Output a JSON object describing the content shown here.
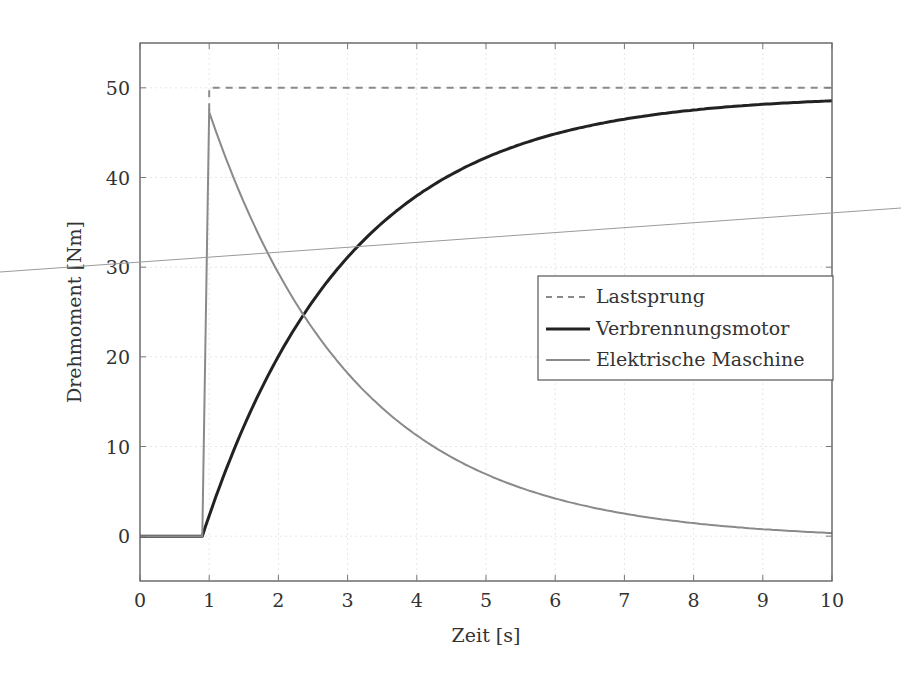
{
  "chart_data": {
    "type": "line",
    "title": "",
    "xlabel": "Zeit [s]",
    "ylabel": "Drehmoment [Nm]",
    "xlim": [
      0,
      10
    ],
    "ylim": [
      -5,
      55
    ],
    "xticks": [
      0,
      1,
      2,
      3,
      4,
      5,
      6,
      7,
      8,
      9,
      10
    ],
    "yticks": [
      0,
      10,
      20,
      30,
      40,
      50
    ],
    "grid": true,
    "legend_position": "right-center",
    "series": [
      {
        "name": "Lastsprung",
        "style": "dashed",
        "color": "#8a8a8a",
        "x": [
          1,
          1,
          10
        ],
        "y": [
          47.5,
          50,
          50
        ]
      },
      {
        "name": "Verbrennungsmotor",
        "style": "solid-thick",
        "color": "#222222",
        "x": [
          0,
          0.9,
          1,
          1.5,
          2,
          2.5,
          3,
          3.5,
          4,
          4.5,
          5,
          5.5,
          6,
          6.5,
          7,
          7.5,
          8,
          8.5,
          9,
          9.5,
          10
        ],
        "y": [
          0,
          0,
          2.4,
          12.2,
          19.9,
          25.9,
          30.6,
          34.3,
          37.2,
          39.5,
          41.3,
          42.7,
          43.8,
          44.6,
          45.3,
          45.8,
          46.3,
          46.6,
          46.9,
          47.1,
          47.3
        ]
      },
      {
        "name": "Elektrische Maschine",
        "style": "solid",
        "color": "#8a8a8a",
        "x": [
          0,
          0.9,
          1,
          1.5,
          2,
          2.5,
          3,
          3.5,
          4,
          4.5,
          5,
          5.5,
          6,
          6.5,
          7,
          7.5,
          8,
          8.5,
          9,
          9.5,
          10
        ],
        "y": [
          0,
          0,
          47.6,
          37.1,
          28.9,
          22.5,
          17.5,
          13.6,
          10.6,
          8.3,
          6.4,
          5.0,
          3.9,
          3.1,
          2.4,
          1.9,
          1.4,
          1.1,
          0.8,
          0.5,
          0.2
        ]
      }
    ],
    "annotations": []
  },
  "legend": {
    "items": [
      {
        "label": "Lastsprung"
      },
      {
        "label": "Verbrennungsmotor"
      },
      {
        "label": "Elektrische Maschine"
      }
    ]
  },
  "axes": {
    "x_title": "Zeit [s]",
    "y_title": "Drehmoment [Nm]"
  }
}
